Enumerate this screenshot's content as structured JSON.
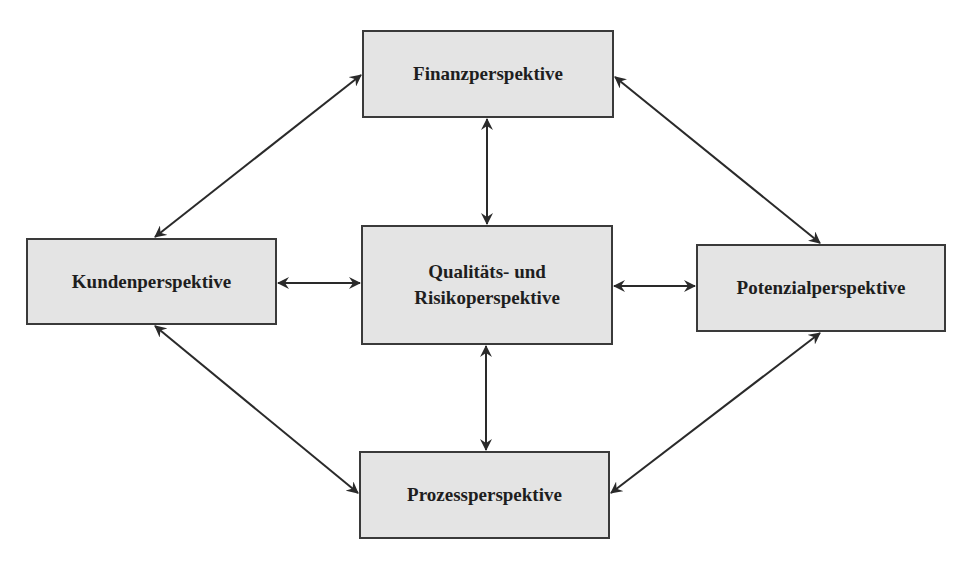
{
  "diagram": {
    "type": "balanced-scorecard-perspectives",
    "colors": {
      "box_fill": "#e4e4e4",
      "box_border": "#3a3a3a",
      "arrow": "#2a2a2a",
      "text": "#1e1e1e",
      "background": "#ffffff"
    },
    "nodes": [
      {
        "id": "finanz",
        "label": "Finanzperspektive",
        "x": 362,
        "y": 30,
        "w": 252,
        "h": 88
      },
      {
        "id": "kunden",
        "label": "Kundenperspektive",
        "x": 26,
        "y": 238,
        "w": 251,
        "h": 87
      },
      {
        "id": "qualitaet",
        "label_line1": "Qualitäts- und",
        "label_line2": "Risikoperspektive",
        "x": 361,
        "y": 225,
        "w": 252,
        "h": 120
      },
      {
        "id": "potenzial",
        "label": "Potenzialperspektive",
        "x": 696,
        "y": 244,
        "w": 250,
        "h": 88
      },
      {
        "id": "prozess",
        "label": "Prozessperspektive",
        "x": 359,
        "y": 451,
        "w": 251,
        "h": 88
      }
    ],
    "edges": [
      {
        "from": "finanz",
        "to": "qualitaet",
        "bidirectional": true
      },
      {
        "from": "qualitaet",
        "to": "prozess",
        "bidirectional": true
      },
      {
        "from": "kunden",
        "to": "qualitaet",
        "bidirectional": true
      },
      {
        "from": "qualitaet",
        "to": "potenzial",
        "bidirectional": true
      },
      {
        "from": "kunden",
        "to": "finanz",
        "bidirectional": true
      },
      {
        "from": "finanz",
        "to": "potenzial",
        "bidirectional": true
      },
      {
        "from": "kunden",
        "to": "prozess",
        "bidirectional": true
      },
      {
        "from": "potenzial",
        "to": "prozess",
        "bidirectional": true
      }
    ]
  }
}
